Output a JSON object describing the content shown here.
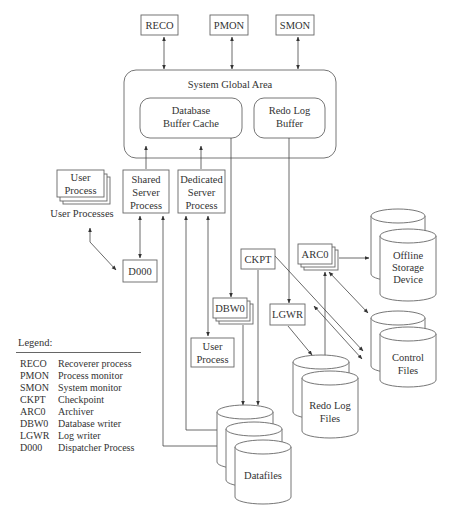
{
  "diagram": {
    "background_processes_top": [
      "RECO",
      "PMON",
      "SMON"
    ],
    "sga": {
      "title": "System Global Area",
      "buffer_cache": [
        "Database",
        "Buffer Cache"
      ],
      "redo_log_buffer": [
        "Redo Log",
        "Buffer"
      ]
    },
    "user_process_stack": [
      "User",
      "Process"
    ],
    "user_processes_label": "User Processes",
    "shared_server": [
      "Shared",
      "Server",
      "Process"
    ],
    "dedicated_server": [
      "Dedicated",
      "Server",
      "Process"
    ],
    "dispatcher": "D000",
    "checkpoint": "CKPT",
    "archiver": "ARC0",
    "db_writer": "DBW0",
    "log_writer": "LGWR",
    "user_process_bottom": [
      "User",
      "Process"
    ],
    "offline_storage": [
      "Offline",
      "Storage",
      "Device"
    ],
    "control_files": [
      "Control",
      "Files"
    ],
    "redo_log_files": [
      "Redo Log",
      "Files"
    ],
    "datafiles": "Datafiles"
  },
  "legend": {
    "title": "Legend:",
    "items": [
      {
        "abbr": "RECO",
        "desc": "Recoverer process"
      },
      {
        "abbr": "PMON",
        "desc": "Process monitor"
      },
      {
        "abbr": "SMON",
        "desc": "System monitor"
      },
      {
        "abbr": "CKPT",
        "desc": "Checkpoint"
      },
      {
        "abbr": "ARC0",
        "desc": "Archiver"
      },
      {
        "abbr": "DBW0",
        "desc": "Database writer"
      },
      {
        "abbr": "LGWR",
        "desc": "Log writer"
      },
      {
        "abbr": "D000",
        "desc": "Dispatcher Process"
      }
    ]
  }
}
